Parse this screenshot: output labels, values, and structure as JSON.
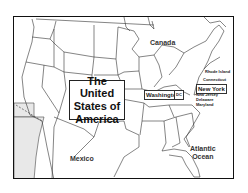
{
  "map": {
    "title_lines": [
      "The United",
      "States of",
      "America"
    ],
    "countries": {
      "canada": "Canada",
      "mexico": "Mexico"
    },
    "ocean": [
      "Atlantic",
      "Ocean"
    ],
    "cities": {
      "washington": "Washington",
      "new_york": "New York"
    },
    "states": {
      "rhode_island": "Rhode Island",
      "connecticut": "Connecticut",
      "new_jersey": "New Jersey",
      "delaware": "Delaware",
      "maryland": "Maryland"
    },
    "colors": {
      "border": "#111111",
      "land": "#ffffff",
      "state_line": "#333333",
      "shaded_area": "#e6e6e6"
    }
  }
}
